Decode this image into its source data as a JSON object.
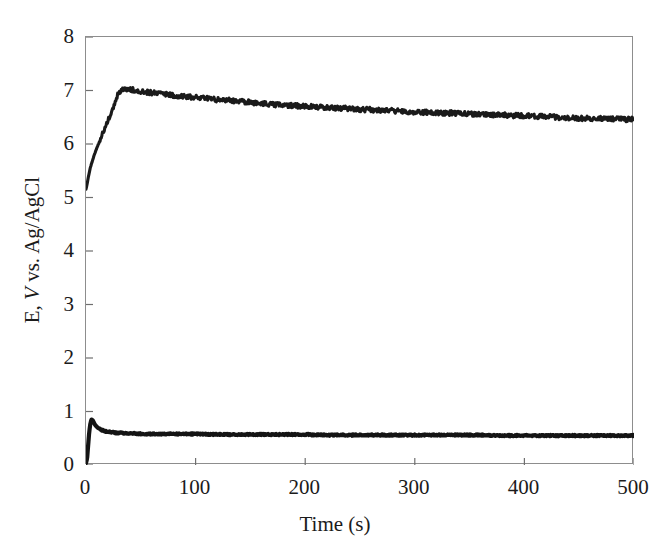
{
  "figure": {
    "width": 670,
    "height": 557,
    "background": "#ffffff",
    "frame_color": "#8d8d8d"
  },
  "chart_data": {
    "type": "line",
    "title": "",
    "subtitle": "",
    "xlabel": "Time (s)",
    "ylabel_parts": {
      "pre": "E, ",
      "italic": "V",
      "post": " vs. Ag/AgCl"
    },
    "ylabel": "E, V vs. Ag/AgCl",
    "xlim": [
      0,
      500
    ],
    "ylim": [
      0,
      8
    ],
    "xticks": [
      0,
      100,
      200,
      300,
      400,
      500
    ],
    "yticks": [
      0,
      1,
      2,
      3,
      4,
      5,
      6,
      7,
      8
    ],
    "xtick_labels": [
      "0",
      "100",
      "200",
      "300",
      "400",
      "500"
    ],
    "ytick_labels": [
      "0",
      "1",
      "2",
      "3",
      "4",
      "5",
      "6",
      "7",
      "8"
    ],
    "grid": false,
    "legend": null,
    "legend_position": "none",
    "tick_direction": "in",
    "series": [
      {
        "name": "upper-trace",
        "color": "#1a1a1a",
        "line_width": 3.1,
        "noise_amplitude": 0.045,
        "x": [
          0,
          1,
          2,
          3,
          4,
          5,
          6,
          8,
          10,
          12,
          14,
          16,
          18,
          20,
          22,
          24,
          26,
          28,
          30,
          33,
          36,
          40,
          45,
          50,
          55,
          60,
          65,
          70,
          75,
          80,
          85,
          90,
          95,
          100,
          110,
          120,
          130,
          140,
          150,
          160,
          170,
          180,
          190,
          200,
          210,
          220,
          230,
          240,
          250,
          260,
          270,
          280,
          290,
          300,
          310,
          320,
          330,
          340,
          350,
          360,
          370,
          380,
          390,
          400,
          410,
          420,
          430,
          440,
          450,
          460,
          470,
          480,
          490,
          500
        ],
        "y": [
          5.16,
          5.25,
          5.37,
          5.47,
          5.56,
          5.63,
          5.7,
          5.82,
          5.93,
          6.03,
          6.13,
          6.23,
          6.33,
          6.43,
          6.54,
          6.65,
          6.76,
          6.87,
          6.96,
          7.02,
          7.04,
          7.02,
          7.0,
          6.99,
          6.97,
          6.96,
          6.95,
          6.94,
          6.93,
          6.91,
          6.9,
          6.89,
          6.88,
          6.87,
          6.85,
          6.83,
          6.82,
          6.8,
          6.78,
          6.76,
          6.74,
          6.73,
          6.72,
          6.7,
          6.69,
          6.68,
          6.67,
          6.66,
          6.65,
          6.64,
          6.63,
          6.62,
          6.61,
          6.6,
          6.59,
          6.58,
          6.58,
          6.57,
          6.56,
          6.55,
          6.55,
          6.54,
          6.53,
          6.53,
          6.52,
          6.51,
          6.5,
          6.49,
          6.48,
          6.48,
          6.47,
          6.47,
          6.46,
          6.46
        ]
      },
      {
        "name": "lower-trace",
        "color": "#141414",
        "line_width": 4.2,
        "noise_amplitude": 0.012,
        "x": [
          0,
          1,
          2,
          3,
          4,
          5,
          6,
          7,
          8,
          10,
          12,
          14,
          16,
          18,
          20,
          24,
          28,
          32,
          36,
          40,
          45,
          50,
          60,
          70,
          80,
          90,
          100,
          120,
          140,
          160,
          180,
          200,
          220,
          240,
          260,
          280,
          300,
          320,
          340,
          360,
          380,
          400,
          420,
          440,
          460,
          480,
          500
        ],
        "y": [
          0.04,
          0.12,
          0.38,
          0.63,
          0.78,
          0.85,
          0.84,
          0.8,
          0.76,
          0.71,
          0.68,
          0.66,
          0.64,
          0.63,
          0.62,
          0.61,
          0.6,
          0.6,
          0.59,
          0.59,
          0.59,
          0.58,
          0.58,
          0.58,
          0.58,
          0.58,
          0.58,
          0.57,
          0.57,
          0.57,
          0.57,
          0.57,
          0.56,
          0.56,
          0.56,
          0.56,
          0.56,
          0.56,
          0.56,
          0.56,
          0.55,
          0.55,
          0.55,
          0.55,
          0.55,
          0.55,
          0.55
        ]
      }
    ]
  }
}
